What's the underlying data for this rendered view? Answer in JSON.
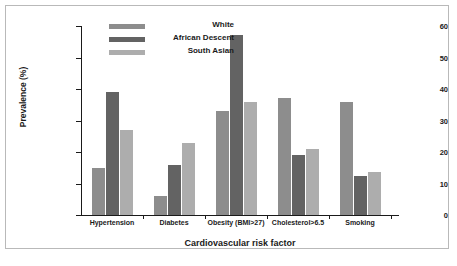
{
  "chart_data": {
    "type": "bar",
    "title": "",
    "xlabel": "Cardiovascular risk factor",
    "ylabel": "Prevalence (%)",
    "ylim": [
      0,
      60
    ],
    "yticks": [
      0,
      10,
      20,
      30,
      40,
      50,
      60
    ],
    "grid": false,
    "legend_position": "top-left",
    "categories": [
      "Hypertension",
      "Diabetes",
      "Obesity (BMI>27)",
      "Cholesterol>6.5",
      "Smoking"
    ],
    "series": [
      {
        "name": "White",
        "color": "#8d8d8d",
        "values": [
          15,
          6,
          33,
          37,
          36
        ]
      },
      {
        "name": "African Descent",
        "color": "#636363",
        "values": [
          39,
          16,
          57,
          19,
          12.5
        ]
      },
      {
        "name": "South Asian",
        "color": "#adadad",
        "values": [
          27,
          23,
          36,
          21,
          13.5
        ]
      }
    ]
  },
  "legend": {
    "entries": [
      {
        "label": "White"
      },
      {
        "label": "African Descent"
      },
      {
        "label": "South Asian"
      }
    ]
  },
  "axes": {
    "y_tick_labels": [
      "0",
      "10",
      "20",
      "30",
      "40",
      "50",
      "60"
    ]
  }
}
